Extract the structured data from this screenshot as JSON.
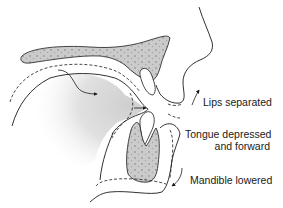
{
  "diagram": {
    "labels": {
      "lips": "Lips separated",
      "tongue_line1": "Tongue depressed",
      "tongue_line2": "and forward",
      "mandible": "Mandible lowered"
    },
    "colors": {
      "bone_fill": "#c9c9c9",
      "tongue_shade": "#d4d4d4",
      "outline": "#1a1a1a",
      "background": "#ffffff"
    },
    "structures": [
      "maxilla-palate",
      "upper-incisor",
      "lower-incisor",
      "mandible-bone",
      "tongue",
      "lips",
      "nose-profile",
      "chin"
    ]
  }
}
